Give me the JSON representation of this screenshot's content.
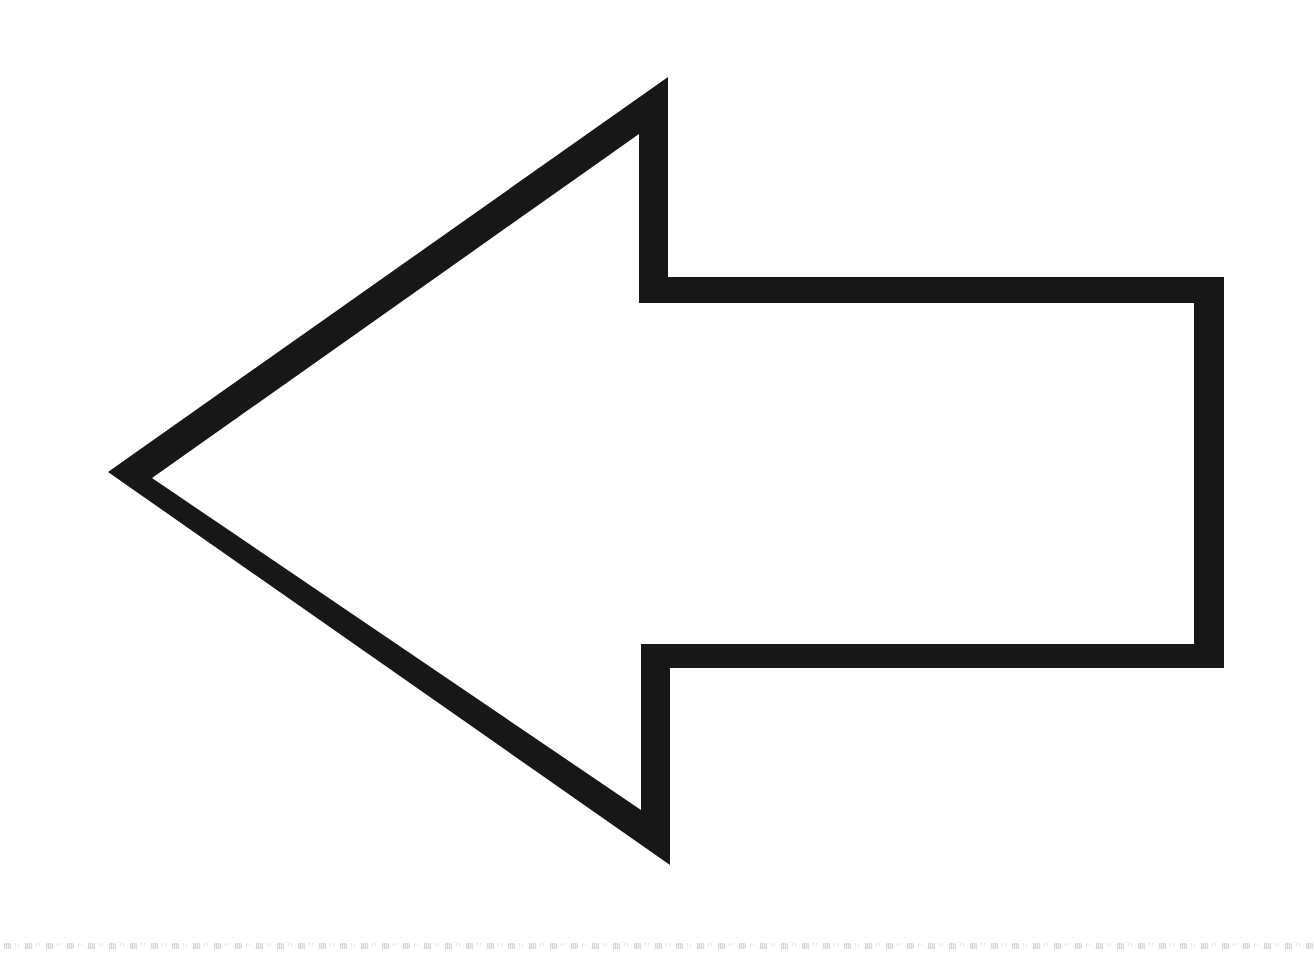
{
  "image": {
    "title": "Left-pointing hollow arrow",
    "description": "A large black outlined arrow pointing to the left on a plain white background",
    "width": 1314,
    "height": 964,
    "background_color": "#ffffff",
    "stroke_color": "#171717",
    "fill_color": "#ffffff"
  },
  "shape": {
    "name": "arrow-left-outline",
    "kind": "arrow",
    "direction": "left",
    "style": "outline",
    "stroke_width_px": 29,
    "outer_path": "M 108 472 L 668 77 L 668 277 L 1224 277 L 1224 668 L 670 668 L 670 865 Z",
    "inner_path": "M 152 478 L 639 134 L 639 303 L 1194 303 L 1194 644 L 641 644 L 641 810 Z",
    "outer_points": [
      {
        "label": "tip",
        "x": 108,
        "y": 472
      },
      {
        "label": "head-top-vertex",
        "x": 668,
        "y": 77
      },
      {
        "label": "head-top-neck",
        "x": 668,
        "y": 277
      },
      {
        "label": "shaft-top-right",
        "x": 1224,
        "y": 277
      },
      {
        "label": "shaft-bottom-right",
        "x": 1224,
        "y": 668
      },
      {
        "label": "head-bottom-neck",
        "x": 670,
        "y": 668
      },
      {
        "label": "head-bottom-vertex",
        "x": 670,
        "y": 865
      }
    ],
    "inner_points": [
      {
        "label": "inner-tip",
        "x": 152,
        "y": 478
      },
      {
        "label": "inner-head-top-vertex",
        "x": 639,
        "y": 134
      },
      {
        "label": "inner-head-top-neck",
        "x": 639,
        "y": 303
      },
      {
        "label": "inner-shaft-top-right",
        "x": 1194,
        "y": 303
      },
      {
        "label": "inner-shaft-bottom-right",
        "x": 1194,
        "y": 644
      },
      {
        "label": "inner-head-bottom-neck",
        "x": 641,
        "y": 644
      },
      {
        "label": "inner-head-bottom-vertex",
        "x": 641,
        "y": 810
      }
    ]
  },
  "artifacts": {
    "bottom_scan_line": {
      "name": "scanner-edge-artifact",
      "color": "#7c7c84",
      "y": 946,
      "dash_period_px": 21
    }
  }
}
